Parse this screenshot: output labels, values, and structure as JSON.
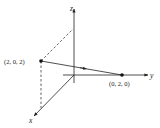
{
  "diagram": {
    "type": "3d-coordinate-axes",
    "axes": [
      {
        "name": "x",
        "label": "x"
      },
      {
        "name": "y",
        "label": "y"
      },
      {
        "name": "z",
        "label": "z"
      }
    ],
    "points": [
      {
        "id": "P",
        "label": "(2, 0, 2)",
        "coords": [
          2,
          0,
          2
        ]
      },
      {
        "id": "Q",
        "label": "(0, 2, 0)",
        "coords": [
          0,
          2,
          0
        ]
      }
    ],
    "vector": {
      "from": "(2, 0, 2)",
      "to": "(0, 2, 0)"
    },
    "colors": {
      "stroke": "#222222",
      "background": "#ffffff"
    }
  }
}
